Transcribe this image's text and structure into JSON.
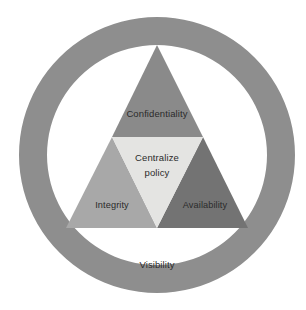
{
  "diagram": {
    "outer_ring": {
      "label": "Visibility",
      "color": "#8e8e8e"
    },
    "background": "#ffffff",
    "inner_circle_color": "#ffffff",
    "segments": [
      {
        "name": "confidentiality",
        "label": "Confidentiality",
        "position": "top",
        "color": "#8a8a8a"
      },
      {
        "name": "integrity",
        "label": "Integrity",
        "position": "bottom-left",
        "color": "#a8a8a8"
      },
      {
        "name": "availability",
        "label": "Availability",
        "position": "bottom-right",
        "color": "#737373"
      },
      {
        "name": "centralize-policy",
        "label": "Centralize",
        "label_line2": "policy",
        "position": "center",
        "color": "#e4e4e2"
      }
    ],
    "text_color": "#2b2b2b"
  }
}
